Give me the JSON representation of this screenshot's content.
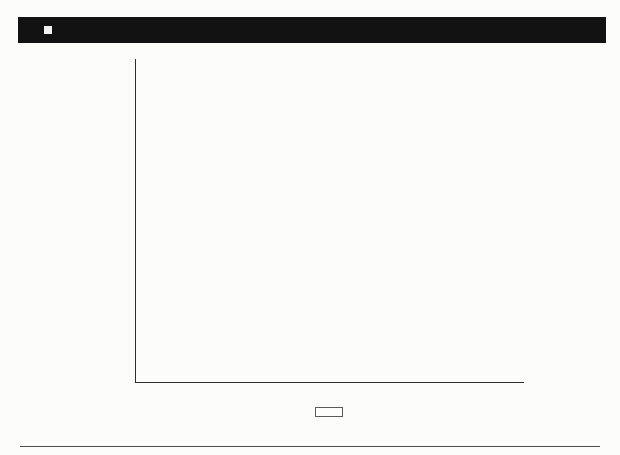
{
  "figure": {
    "label": "FIGURE 5.10",
    "separator_icon": "filled-square"
  },
  "chart_data": {
    "type": "bar",
    "orientation": "horizontal",
    "categories": [
      "2019",
      "2018",
      "2017",
      "2016",
      "2015",
      "2014"
    ],
    "series": [
      {
        "name": "Offenders",
        "color": "#c8c8c8",
        "values": [
          1391,
          523,
          333,
          463,
          276,
          245
        ]
      },
      {
        "name": "Allegations",
        "color": "#969190",
        "values": [
          2237,
          1051,
          436,
          914,
          392,
          334
        ]
      },
      {
        "name": "Victims",
        "color": "#5d5552",
        "values": [
          2237,
          1044,
          431,
          911,
          384,
          330
        ]
      }
    ],
    "value_labels": [
      [
        "1,391",
        "2,237",
        "2,237"
      ],
      [
        "523",
        "1,051",
        "1,044"
      ],
      [
        "333",
        "436",
        "431"
      ],
      [
        "463",
        "914",
        "911"
      ],
      [
        "276",
        "392",
        "384"
      ],
      [
        "245",
        "334",
        "330"
      ]
    ],
    "xlabel": "",
    "ylabel": "",
    "xlim": [
      0,
      2500
    ],
    "x_ticks": [
      0,
      500,
      1000,
      1500,
      2000,
      2500
    ],
    "x_tick_labels": [
      "0",
      "500",
      "1,000",
      "1,500",
      "2,000",
      "2,500"
    ],
    "grid": false,
    "legend": [
      "Offenders",
      "Allegations",
      "Victims"
    ],
    "legend_position": "bottom",
    "bar_border_color": "#403c3b",
    "axis_color": "#2e2e2e"
  }
}
